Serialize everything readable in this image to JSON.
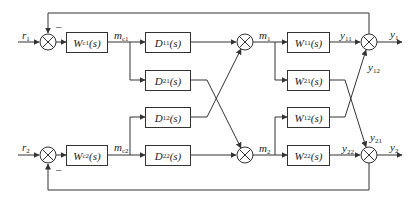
{
  "diagram": {
    "inputs": {
      "r1": "r",
      "r1_sub": "1",
      "r2": "r",
      "r2_sub": "2"
    },
    "controllers": [
      {
        "name": "W",
        "sub": "c1",
        "arg": "(s)"
      },
      {
        "name": "W",
        "sub": "c2",
        "arg": "(s)"
      }
    ],
    "controller_outputs": [
      {
        "name": "m",
        "sub": "c1"
      },
      {
        "name": "m",
        "sub": "c2"
      }
    ],
    "decouplers": [
      {
        "name": "D",
        "sub": "11",
        "arg": "(s)"
      },
      {
        "name": "D",
        "sub": "21",
        "arg": "(s)"
      },
      {
        "name": "D",
        "sub": "12",
        "arg": "(s)"
      },
      {
        "name": "D",
        "sub": "22",
        "arg": "(s)"
      }
    ],
    "manipulated": [
      {
        "name": "m",
        "sub": "1"
      },
      {
        "name": "m",
        "sub": "2"
      }
    ],
    "plant": [
      {
        "name": "W",
        "sub": "11",
        "arg": "(s)"
      },
      {
        "name": "W",
        "sub": "21",
        "arg": "(s)"
      },
      {
        "name": "W",
        "sub": "12",
        "arg": "(s)"
      },
      {
        "name": "W",
        "sub": "22",
        "arg": "(s)"
      }
    ],
    "intermediate": [
      {
        "name": "y",
        "sub": "11"
      },
      {
        "name": "y",
        "sub": "12"
      },
      {
        "name": "y",
        "sub": "21"
      },
      {
        "name": "y",
        "sub": "22"
      }
    ],
    "outputs": [
      {
        "name": "y",
        "sub": "1"
      },
      {
        "name": "y",
        "sub": "2"
      }
    ],
    "feedback_sign": "−"
  }
}
